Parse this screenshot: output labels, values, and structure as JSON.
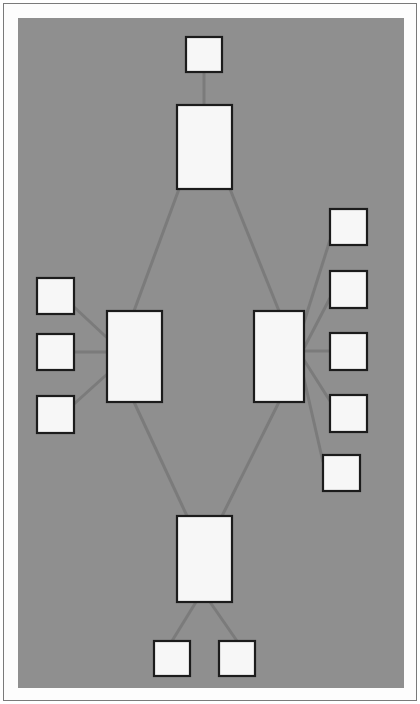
{
  "document": {
    "title": "Network Topology Diagram",
    "note": "NOTE: Each rectangle represents a computer."
  },
  "canvas": {
    "background_color": "#8f8f8f",
    "page_background_color": "#fdfdfd",
    "frame_border_color": "#7a7a7a",
    "width": 386,
    "height": 670
  },
  "style": {
    "node_fill": "#f7f7f7",
    "node_stroke": "#1c1c1c",
    "node_stroke_width": 2.2,
    "link_stroke": "#7b7b7b",
    "link_stroke_width": 3
  },
  "diagram": {
    "type": "network-topology",
    "node_meaning": "computer",
    "node_count": 14,
    "link_count": 13,
    "nodes": [
      {
        "id": "top-leaf",
        "label": "",
        "x": 168,
        "y": 19,
        "w": 36,
        "h": 35,
        "size": "small"
      },
      {
        "id": "top-hub",
        "label": "",
        "x": 159,
        "y": 87,
        "w": 55,
        "h": 84,
        "size": "large"
      },
      {
        "id": "left-hub",
        "label": "",
        "x": 89,
        "y": 293,
        "w": 55,
        "h": 91,
        "size": "large"
      },
      {
        "id": "right-hub",
        "label": "",
        "x": 236,
        "y": 293,
        "w": 50,
        "h": 91,
        "size": "large"
      },
      {
        "id": "bottom-hub",
        "label": "",
        "x": 159,
        "y": 498,
        "w": 55,
        "h": 86,
        "size": "large"
      },
      {
        "id": "left-leaf-1",
        "label": "",
        "x": 19,
        "y": 260,
        "w": 37,
        "h": 36,
        "size": "small"
      },
      {
        "id": "left-leaf-2",
        "label": "",
        "x": 19,
        "y": 316,
        "w": 37,
        "h": 36,
        "size": "small"
      },
      {
        "id": "left-leaf-3",
        "label": "",
        "x": 19,
        "y": 378,
        "w": 37,
        "h": 37,
        "size": "small"
      },
      {
        "id": "right-leaf-1",
        "label": "",
        "x": 312,
        "y": 191,
        "w": 37,
        "h": 36,
        "size": "small"
      },
      {
        "id": "right-leaf-2",
        "label": "",
        "x": 312,
        "y": 253,
        "w": 37,
        "h": 37,
        "size": "small"
      },
      {
        "id": "right-leaf-3",
        "label": "",
        "x": 312,
        "y": 315,
        "w": 37,
        "h": 37,
        "size": "small"
      },
      {
        "id": "right-leaf-4",
        "label": "",
        "x": 312,
        "y": 377,
        "w": 37,
        "h": 37,
        "size": "small"
      },
      {
        "id": "right-leaf-5",
        "label": "",
        "x": 305,
        "y": 437,
        "w": 37,
        "h": 36,
        "size": "small"
      },
      {
        "id": "bottom-leaf-1",
        "label": "",
        "x": 136,
        "y": 623,
        "w": 36,
        "h": 35,
        "size": "small"
      },
      {
        "id": "bottom-leaf-2",
        "label": "",
        "x": 201,
        "y": 623,
        "w": 36,
        "h": 35,
        "size": "small"
      }
    ],
    "links": [
      {
        "from": "top-leaf",
        "to": "top-hub",
        "x1": 186,
        "y1": 54,
        "x2": 186,
        "y2": 87
      },
      {
        "from": "top-hub",
        "to": "left-hub",
        "x1": 161,
        "y1": 171,
        "x2": 116,
        "y2": 293
      },
      {
        "from": "top-hub",
        "to": "right-hub",
        "x1": 212,
        "y1": 171,
        "x2": 261,
        "y2": 293
      },
      {
        "from": "left-hub",
        "to": "bottom-hub",
        "x1": 116,
        "y1": 384,
        "x2": 169,
        "y2": 498
      },
      {
        "from": "right-hub",
        "to": "bottom-hub",
        "x1": 261,
        "y1": 384,
        "x2": 204,
        "y2": 498
      },
      {
        "from": "left-leaf-1",
        "to": "left-hub",
        "x1": 56,
        "y1": 289,
        "x2": 100,
        "y2": 330
      },
      {
        "from": "left-leaf-2",
        "to": "left-hub",
        "x1": 56,
        "y1": 334,
        "x2": 89,
        "y2": 334
      },
      {
        "from": "left-leaf-3",
        "to": "left-hub",
        "x1": 56,
        "y1": 386,
        "x2": 107,
        "y2": 340
      },
      {
        "from": "right-leaf-1",
        "to": "right-hub",
        "x1": 312,
        "y1": 222,
        "x2": 281,
        "y2": 320
      },
      {
        "from": "right-leaf-2",
        "to": "right-hub",
        "x1": 312,
        "y1": 280,
        "x2": 286,
        "y2": 330
      },
      {
        "from": "right-leaf-3",
        "to": "right-hub",
        "x1": 312,
        "y1": 333,
        "x2": 286,
        "y2": 333
      },
      {
        "from": "right-leaf-4",
        "to": "right-hub",
        "x1": 312,
        "y1": 383,
        "x2": 286,
        "y2": 342
      },
      {
        "from": "right-leaf-5",
        "to": "right-hub",
        "x1": 305,
        "y1": 444,
        "x2": 284,
        "y2": 352
      },
      {
        "from": "bottom-hub",
        "to": "bottom-leaf-1",
        "x1": 178,
        "y1": 584,
        "x2": 154,
        "y2": 623
      },
      {
        "from": "bottom-hub",
        "to": "bottom-leaf-2",
        "x1": 192,
        "y1": 584,
        "x2": 219,
        "y2": 623
      }
    ]
  }
}
